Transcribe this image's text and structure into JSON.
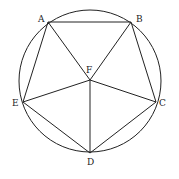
{
  "diagram": {
    "title": "",
    "circle": {
      "cx": 90,
      "cy": 81,
      "r": 71
    },
    "points": [
      {
        "name": "A",
        "x": 48,
        "y": 22,
        "lx": 38,
        "ly": 22
      },
      {
        "name": "B",
        "x": 131,
        "y": 22,
        "lx": 136,
        "ly": 22
      },
      {
        "name": "C",
        "x": 156,
        "y": 102,
        "lx": 159,
        "ly": 106
      },
      {
        "name": "D",
        "x": 90,
        "y": 153,
        "lx": 87,
        "ly": 165
      },
      {
        "name": "E",
        "x": 23,
        "y": 102,
        "lx": 12,
        "ly": 106
      },
      {
        "name": "F",
        "x": 90,
        "y": 80,
        "lx": 86,
        "ly": 73
      }
    ],
    "segments": [
      [
        "A",
        "B"
      ],
      [
        "B",
        "C"
      ],
      [
        "C",
        "D"
      ],
      [
        "D",
        "E"
      ],
      [
        "E",
        "A"
      ],
      [
        "F",
        "A"
      ],
      [
        "F",
        "B"
      ],
      [
        "F",
        "C"
      ],
      [
        "F",
        "D"
      ],
      [
        "F",
        "E"
      ]
    ],
    "stroke_color": "#222222"
  }
}
